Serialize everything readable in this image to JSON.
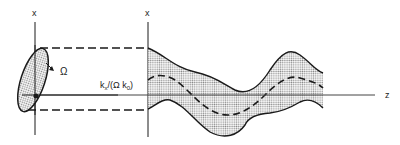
{
  "diagram": {
    "type": "beam-propagation-schematic",
    "labels": {
      "x_axis_left": "x",
      "x_axis_right": "x",
      "z_axis": "z",
      "omega": "Ω",
      "ray_label": "kx/(Ωk0)"
    },
    "ray_label_parts": {
      "k": "k",
      "sub_x": "x",
      "mid": "/(Ω k",
      "sub_0": "0",
      "close": ")"
    },
    "colors": {
      "stroke": "#1a1a1a",
      "fill_dots": "#9a9a9a",
      "axis_gray": "#555555",
      "background": "#ffffff"
    },
    "elements": [
      "left ellipse (initial cross-section, shaded)",
      "dashed projection lines to second x-axis",
      "shaded beam envelope along z",
      "dashed centroid trajectory",
      "horizontal z axis"
    ]
  }
}
